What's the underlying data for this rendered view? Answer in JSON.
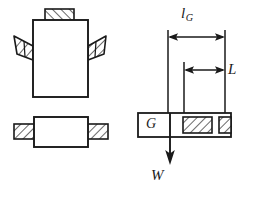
{
  "figure": {
    "colors": {
      "stroke": "#1a1a1a",
      "fill": "#ffffff",
      "background": "#ffffff",
      "hatch": "#1a1a1a"
    },
    "views": [
      {
        "id": "front-view",
        "name": "front-view-with-angled-pads",
        "position": "top-left",
        "body": {
          "x": 33,
          "y": 20,
          "width": 55,
          "height": 77
        },
        "pads": [
          {
            "id": "top-pad",
            "name": "top-hatched-pad",
            "hatched": true
          },
          {
            "id": "left-pad",
            "name": "left-angled-hatched-pad",
            "hatched": true
          },
          {
            "id": "right-pad",
            "name": "right-angled-hatched-pad",
            "hatched": true
          }
        ]
      },
      {
        "id": "plan-view",
        "name": "plan-view-with-side-pads",
        "position": "bottom-left",
        "body": {
          "x": 34,
          "y": 117,
          "width": 54,
          "height": 30
        },
        "pads": [
          {
            "id": "left-pad",
            "name": "left-hatched-pad",
            "hatched": true
          },
          {
            "id": "right-pad",
            "name": "right-hatched-pad",
            "hatched": true
          }
        ]
      },
      {
        "id": "dimensioned-view",
        "name": "dimensioned-plan-view",
        "position": "right",
        "body": {
          "x": 138,
          "y": 113,
          "width": 93,
          "height": 24
        },
        "pads": [
          {
            "id": "inner-pad",
            "name": "inner-hatched-pad",
            "hatched": true
          },
          {
            "id": "outer-pad",
            "name": "outer-hatched-pad",
            "hatched": true
          }
        ]
      }
    ],
    "dimensions": [
      {
        "id": "dim-lg",
        "name": "dimension-lg",
        "symbol": "l",
        "subscript": "G",
        "arrow_style": "double-headed",
        "from_x": 168,
        "to_x": 225,
        "y": 37
      },
      {
        "id": "dim-L",
        "name": "dimension-L",
        "symbol": "L",
        "subscript": "",
        "arrow_style": "double-headed",
        "from_x": 184,
        "to_x": 225,
        "y": 70
      }
    ],
    "annotations": [
      {
        "id": "point-G",
        "name": "center-of-gravity-label",
        "symbol": "G",
        "x": 146,
        "y": 117
      },
      {
        "id": "force-W",
        "name": "weight-force-label",
        "symbol": "W",
        "direction": "down",
        "x": 151,
        "y": 168,
        "arrow_from_y": 113,
        "arrow_to_y": 163,
        "arrow_x": 170
      }
    ]
  }
}
